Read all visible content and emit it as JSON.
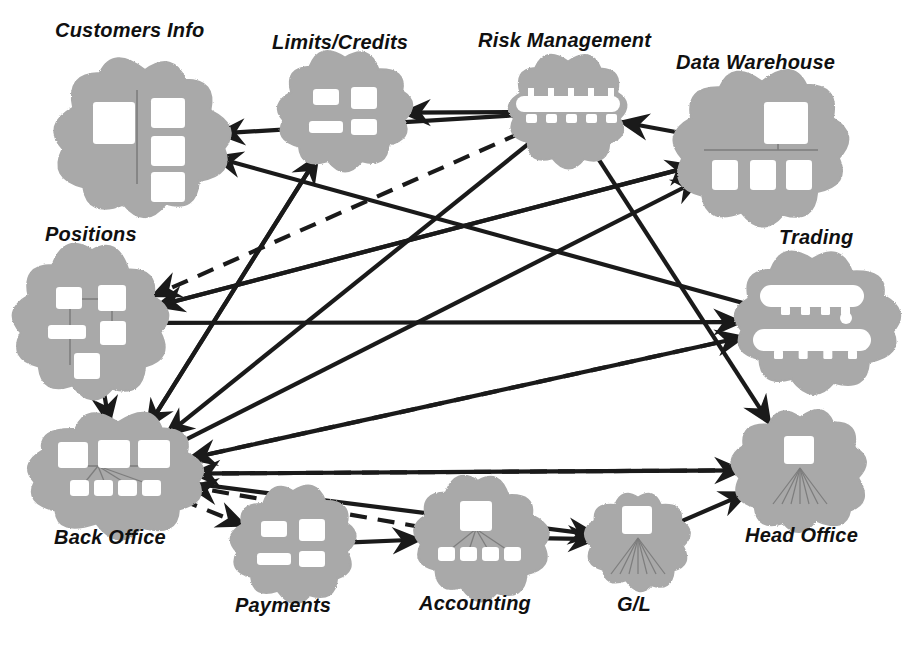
{
  "diagram": {
    "type": "network-topology",
    "style": {
      "cloud_fill": "#a9a9a9",
      "cloud_inner": "#ffffff",
      "line_color": "#1a1a1a",
      "background": "#ffffff",
      "label_color": "#101010"
    },
    "nodes": [
      {
        "id": "customers_info",
        "label": "Customers Info",
        "cx": 145,
        "cy": 138,
        "rx": 78,
        "ry": 72,
        "label_x": 55,
        "label_y": 20,
        "label_size": 20,
        "icon": "server-with-three-clients"
      },
      {
        "id": "limits_credits",
        "label": "Limits/Credits",
        "cx": 345,
        "cy": 113,
        "rx": 62,
        "ry": 52,
        "label_x": 272,
        "label_y": 32,
        "label_size": 20,
        "icon": "four-hosts"
      },
      {
        "id": "risk_management",
        "label": "Risk Management",
        "cx": 568,
        "cy": 112,
        "rx": 58,
        "ry": 50,
        "label_x": 478,
        "label_y": 30,
        "label_size": 20,
        "icon": "bus-with-nodes"
      },
      {
        "id": "data_warehouse",
        "label": "Data Warehouse",
        "cx": 762,
        "cy": 148,
        "rx": 76,
        "ry": 70,
        "label_x": 676,
        "label_y": 52,
        "label_size": 20,
        "icon": "warehouse-server-bus"
      },
      {
        "id": "positions",
        "label": "Positions",
        "cx": 92,
        "cy": 323,
        "rx": 72,
        "ry": 68,
        "label_x": 45,
        "label_y": 224,
        "label_size": 20,
        "icon": "four-hosts-plus"
      },
      {
        "id": "trading",
        "label": "Trading",
        "cx": 812,
        "cy": 322,
        "rx": 76,
        "ry": 62,
        "label_x": 779,
        "label_y": 227,
        "label_size": 20,
        "icon": "double-bus"
      },
      {
        "id": "back_office",
        "label": "Back Office",
        "cx": 118,
        "cy": 474,
        "rx": 80,
        "ry": 54,
        "label_x": 54,
        "label_y": 527,
        "label_size": 20,
        "icon": "three-servers-four-clients"
      },
      {
        "id": "payments",
        "label": "Payments",
        "cx": 293,
        "cy": 545,
        "rx": 57,
        "ry": 50,
        "label_x": 235,
        "label_y": 595,
        "label_size": 20,
        "icon": "four-hosts"
      },
      {
        "id": "accounting",
        "label": "Accounting",
        "cx": 478,
        "cy": 537,
        "rx": 62,
        "ry": 55,
        "label_x": 419,
        "label_y": 593,
        "label_size": 20,
        "icon": "server-fan-four-clients"
      },
      {
        "id": "gl",
        "label": "G/L",
        "cx": 638,
        "cy": 540,
        "rx": 45,
        "ry": 44,
        "label_x": 617,
        "label_y": 594,
        "label_size": 20,
        "icon": "server-fan"
      },
      {
        "id": "head_office",
        "label": "Head Office",
        "cx": 800,
        "cy": 470,
        "rx": 62,
        "ry": 58,
        "label_x": 745,
        "label_y": 525,
        "label_size": 20,
        "icon": "server-fan"
      }
    ],
    "edges": [
      {
        "id": "e1",
        "from": "risk_management",
        "to": "limits_credits",
        "style": "solid",
        "arrow": "end"
      },
      {
        "id": "e2",
        "from": "data_warehouse",
        "to": "risk_management",
        "style": "solid",
        "arrow": "end"
      },
      {
        "id": "e3",
        "from": "risk_management",
        "to": "customers_info",
        "style": "solid",
        "arrow": "end"
      },
      {
        "id": "e4",
        "from": "trading",
        "to": "customers_info",
        "style": "solid",
        "arrow": "end"
      },
      {
        "id": "e5",
        "from": "back_office",
        "to": "limits_credits",
        "style": "solid",
        "arrow": "end"
      },
      {
        "id": "e6",
        "from": "data_warehouse",
        "to": "positions",
        "style": "solid",
        "arrow": "end"
      },
      {
        "id": "e7",
        "from": "limits_credits",
        "to": "back_office",
        "style": "solid",
        "arrow": "end"
      },
      {
        "id": "e8",
        "from": "risk_management",
        "to": "back_office",
        "style": "solid",
        "arrow": "end"
      },
      {
        "id": "e9",
        "from": "positions",
        "to": "data_warehouse",
        "style": "solid",
        "arrow": "end"
      },
      {
        "id": "e10",
        "from": "back_office",
        "to": "data_warehouse",
        "style": "solid",
        "arrow": "end"
      },
      {
        "id": "e11",
        "from": "positions",
        "to": "trading",
        "style": "solid",
        "arrow": "end"
      },
      {
        "id": "e12",
        "from": "back_office",
        "to": "trading",
        "style": "solid",
        "arrow": "end"
      },
      {
        "id": "e13",
        "from": "risk_management",
        "to": "head_office",
        "style": "solid",
        "arrow": "end"
      },
      {
        "id": "e14",
        "from": "back_office",
        "to": "head_office",
        "style": "solid",
        "arrow": "end"
      },
      {
        "id": "e15",
        "from": "positions",
        "to": "back_office",
        "style": "solid",
        "arrow": "both"
      },
      {
        "id": "e16",
        "from": "back_office",
        "to": "payments",
        "style": "dashed",
        "arrow": "end"
      },
      {
        "id": "e17",
        "from": "payments",
        "to": "accounting",
        "style": "solid",
        "arrow": "both"
      },
      {
        "id": "e18",
        "from": "accounting",
        "to": "gl",
        "style": "solid",
        "arrow": "both"
      },
      {
        "id": "e19",
        "from": "gl",
        "to": "head_office",
        "style": "solid",
        "arrow": "end"
      },
      {
        "id": "e20",
        "from": "back_office",
        "to": "gl",
        "style": "solid",
        "arrow": "end"
      },
      {
        "id": "e21",
        "from": "trading",
        "to": "back_office",
        "style": "dashed",
        "arrow": "end"
      },
      {
        "id": "e22",
        "from": "head_office",
        "to": "back_office",
        "style": "dashed",
        "arrow": "end"
      },
      {
        "id": "e23",
        "from": "accounting",
        "to": "back_office",
        "style": "dashed",
        "arrow": "end"
      },
      {
        "id": "e24",
        "from": "risk_management",
        "to": "positions",
        "style": "dashed",
        "arrow": "end"
      }
    ]
  }
}
